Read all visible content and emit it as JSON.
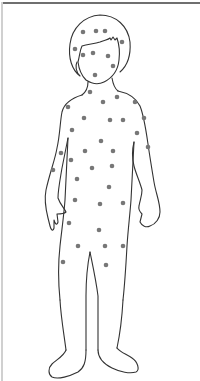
{
  "diagram": {
    "title": "",
    "subject": "child body outline",
    "outline_color": "#333333",
    "spot_color": "#777777",
    "border_color": "#6f6f6f",
    "spot_radius": 2.3,
    "spots": [
      {
        "region": "head",
        "x": 83,
        "y": 32
      },
      {
        "region": "head",
        "x": 96,
        "y": 31
      },
      {
        "region": "head",
        "x": 105,
        "y": 31
      },
      {
        "region": "head",
        "x": 122,
        "y": 42
      },
      {
        "region": "head",
        "x": 75,
        "y": 49
      },
      {
        "region": "face",
        "x": 83,
        "y": 55
      },
      {
        "region": "face",
        "x": 93,
        "y": 53
      },
      {
        "region": "face",
        "x": 108,
        "y": 56
      },
      {
        "region": "face",
        "x": 113,
        "y": 66
      },
      {
        "region": "face",
        "x": 95,
        "y": 75
      },
      {
        "region": "neck",
        "x": 90,
        "y": 92
      },
      {
        "region": "shoulder-left",
        "x": 68,
        "y": 107
      },
      {
        "region": "chest",
        "x": 103,
        "y": 102
      },
      {
        "region": "chest",
        "x": 117,
        "y": 97
      },
      {
        "region": "shoulder-right",
        "x": 135,
        "y": 102
      },
      {
        "region": "chest",
        "x": 84,
        "y": 118
      },
      {
        "region": "chest",
        "x": 110,
        "y": 120
      },
      {
        "region": "chest",
        "x": 123,
        "y": 120
      },
      {
        "region": "arm-right",
        "x": 144,
        "y": 118
      },
      {
        "region": "arm-left",
        "x": 72,
        "y": 130
      },
      {
        "region": "torso",
        "x": 137,
        "y": 133
      },
      {
        "region": "torso",
        "x": 101,
        "y": 141
      },
      {
        "region": "arm-right",
        "x": 148,
        "y": 147
      },
      {
        "region": "arm-left",
        "x": 61,
        "y": 153
      },
      {
        "region": "torso",
        "x": 85,
        "y": 151
      },
      {
        "region": "torso",
        "x": 113,
        "y": 151
      },
      {
        "region": "torso",
        "x": 71,
        "y": 160
      },
      {
        "region": "torso",
        "x": 92,
        "y": 168
      },
      {
        "region": "torso",
        "x": 112,
        "y": 166
      },
      {
        "region": "arm-left",
        "x": 53,
        "y": 170
      },
      {
        "region": "torso",
        "x": 77,
        "y": 179
      },
      {
        "region": "torso",
        "x": 109,
        "y": 187
      },
      {
        "region": "torso",
        "x": 75,
        "y": 200
      },
      {
        "region": "torso",
        "x": 100,
        "y": 204
      },
      {
        "region": "torso",
        "x": 123,
        "y": 203
      },
      {
        "region": "hip-left",
        "x": 69,
        "y": 223
      },
      {
        "region": "pelvis",
        "x": 99,
        "y": 230
      },
      {
        "region": "thigh-left",
        "x": 78,
        "y": 246
      },
      {
        "region": "thigh-right",
        "x": 105,
        "y": 246
      },
      {
        "region": "thigh-right",
        "x": 123,
        "y": 246
      },
      {
        "region": "thigh-left",
        "x": 63,
        "y": 262
      },
      {
        "region": "thigh-right",
        "x": 106,
        "y": 265
      }
    ]
  }
}
